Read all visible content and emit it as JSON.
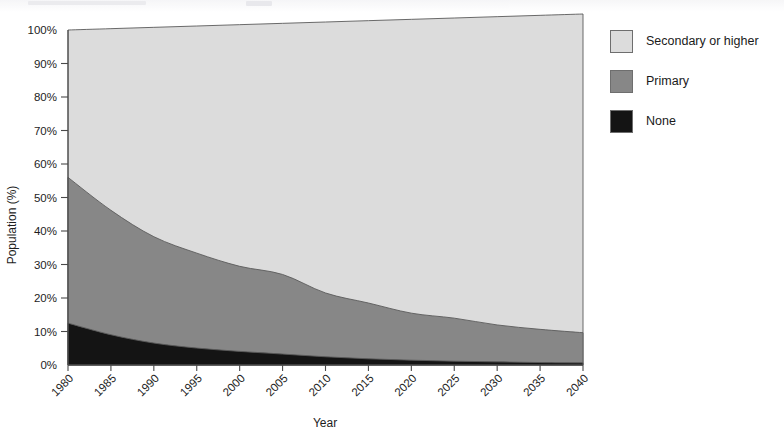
{
  "figure": {
    "background_color": "#ffffff",
    "axis_color": "#4a4a4a"
  },
  "chart_data": {
    "type": "area",
    "stacked": true,
    "title": "",
    "subtitle": "",
    "xlabel": "Year",
    "ylabel": "Population (%)",
    "xlim": [
      1980,
      2040
    ],
    "ylim": [
      0,
      100
    ],
    "grid": false,
    "legend_position": "right",
    "x": [
      1980,
      1985,
      1990,
      1995,
      2000,
      2005,
      2010,
      2015,
      2020,
      2025,
      2030,
      2035,
      2040
    ],
    "xtick_labels": [
      "1980",
      "1985",
      "1990",
      "1995",
      "2000",
      "2005",
      "2010",
      "2015",
      "2020",
      "2025",
      "2030",
      "2035",
      "2040"
    ],
    "xtick_rotation": 45,
    "ytick_labels": [
      "0%",
      "10%",
      "20%",
      "30%",
      "40%",
      "50%",
      "60%",
      "70%",
      "80%",
      "90%",
      "100%"
    ],
    "ytick_values": [
      0,
      10,
      20,
      30,
      40,
      50,
      60,
      70,
      80,
      90,
      100
    ],
    "series": [
      {
        "name": "None",
        "color": "#141414",
        "stack_order": 1,
        "values": [
          12.5,
          9.0,
          6.5,
          5.0,
          4.0,
          3.2,
          2.4,
          1.8,
          1.4,
          1.1,
          0.9,
          0.7,
          0.6
        ]
      },
      {
        "name": "Primary",
        "color": "#878787",
        "stack_order": 2,
        "values": [
          43.5,
          37.0,
          31.5,
          28.0,
          25.0,
          23.3,
          18.6,
          16.2,
          13.6,
          12.4,
          10.6,
          9.5,
          8.6
        ]
      },
      {
        "name": "Secondary or higher",
        "color": "#dcdcdc",
        "stack_order": 3,
        "values": [
          44.0,
          54.0,
          62.0,
          67.0,
          71.0,
          73.5,
          79.0,
          82.0,
          85.0,
          86.5,
          88.5,
          89.8,
          90.8
        ]
      }
    ],
    "cumulative_none": [
      12.5,
      9.0,
      6.5,
      5.0,
      4.0,
      3.2,
      2.4,
      1.8,
      1.4,
      1.1,
      0.9,
      0.7,
      0.6
    ],
    "cumulative_primary": [
      56.0,
      46.0,
      38.0,
      33.0,
      29.0,
      26.5,
      21.0,
      18.0,
      15.0,
      13.5,
      11.5,
      10.2,
      9.2
    ]
  },
  "legend": {
    "entries": [
      {
        "label": "Secondary or higher",
        "color": "#dcdcdc"
      },
      {
        "label": "Primary",
        "color": "#878787"
      },
      {
        "label": "None",
        "color": "#141414"
      }
    ]
  }
}
